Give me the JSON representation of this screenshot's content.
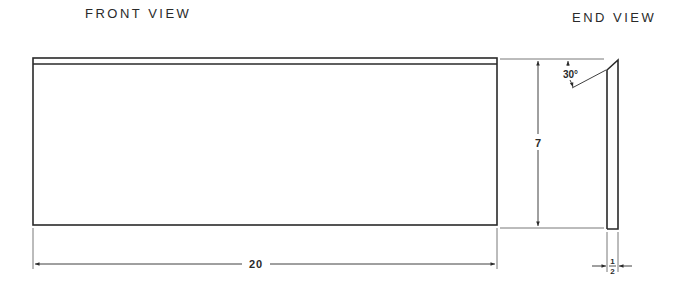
{
  "title_left": "FRONT VIEW",
  "title_right": "END VIEW",
  "dimensions": {
    "length": "20",
    "height": "7",
    "thickness_num": "1",
    "thickness_den": "2",
    "angle": "30°"
  },
  "colors": {
    "line": "#2a2a2a",
    "thin_line": "#555555",
    "background": "#ffffff"
  }
}
